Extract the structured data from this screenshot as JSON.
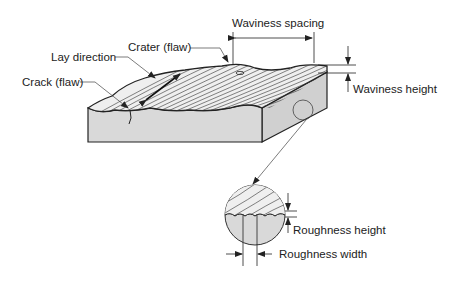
{
  "diagram": {
    "labels": {
      "crater": "Crater (flaw)",
      "lay_direction": "Lay direction",
      "crack": "Crack (flaw)",
      "waviness_spacing": "Waviness spacing",
      "waviness_height": "Waviness height",
      "roughness_height": "Roughness height",
      "roughness_width": "Roughness width"
    },
    "colors": {
      "face_fill": "#d9d9d9",
      "top_fill": "#ececec",
      "line": "#222222",
      "background": "#ffffff"
    }
  }
}
